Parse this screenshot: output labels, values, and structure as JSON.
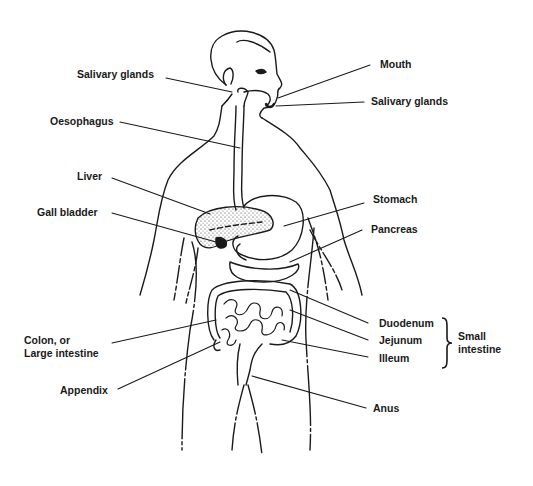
{
  "diagram": {
    "labels_left": [
      {
        "id": "salivary-glands-left",
        "text": "Salivary glands"
      },
      {
        "id": "oesophagus",
        "text": "Oesophagus"
      },
      {
        "id": "liver",
        "text": "Liver"
      },
      {
        "id": "gall-bladder",
        "text": "Gall bladder"
      },
      {
        "id": "colon",
        "text": "Colon, or\nLarge intestine"
      },
      {
        "id": "appendix",
        "text": "Appendix"
      }
    ],
    "labels_right": [
      {
        "id": "mouth",
        "text": "Mouth"
      },
      {
        "id": "salivary-glands-right",
        "text": "Salivary glands"
      },
      {
        "id": "stomach",
        "text": "Stomach"
      },
      {
        "id": "pancreas",
        "text": "Pancreas"
      },
      {
        "id": "duodenum",
        "text": "Duodenum"
      },
      {
        "id": "jejunum",
        "text": "Jejunum"
      },
      {
        "id": "ileum",
        "text": "Illeum"
      },
      {
        "id": "anus",
        "text": "Anus"
      }
    ],
    "group": {
      "text": "Small\nintestine",
      "members": [
        "Duodenum",
        "Jejunum",
        "Illeum"
      ]
    },
    "colors": {
      "ink": "#1a1a1a",
      "background": "#ffffff"
    }
  }
}
